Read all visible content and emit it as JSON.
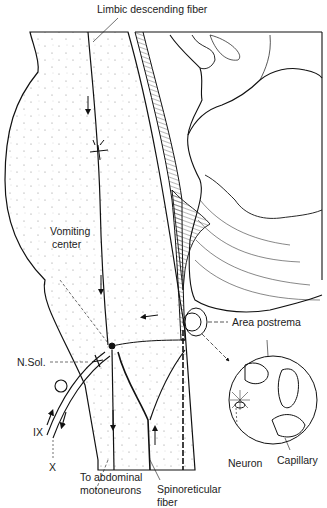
{
  "figure": {
    "type": "anatomical-diagram",
    "colors": {
      "ink": "#111111",
      "background": "#ffffff",
      "stipple": "#9a9a9a"
    }
  },
  "labels": {
    "limbic_fiber": "Limbic descending fiber",
    "vomiting_center_line1": "Vomiting",
    "vomiting_center_line2": "center",
    "area_postrema": "Area postrema",
    "n_sol": "N.Sol.",
    "ix": "IX",
    "x": "X",
    "abdominal_line1": "To abdominal",
    "abdominal_line2": "motoneurons",
    "spinoreticular_line1": "Spinoreticular",
    "spinoreticular_line2": "fiber",
    "neuron": "Neuron",
    "capillary": "Capillary"
  }
}
